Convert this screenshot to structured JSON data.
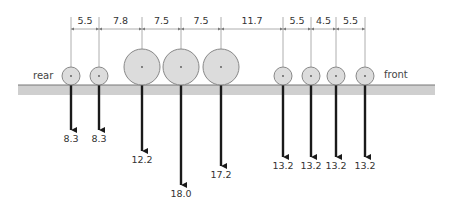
{
  "diagram": {
    "side_labels": {
      "rear": "rear",
      "front": "front"
    },
    "spacings": [
      "5.5",
      "7.8",
      "7.5",
      "7.5",
      "11.7",
      "5.5",
      "4.5",
      "5.5"
    ],
    "axles": [
      {
        "x": 71,
        "r": 9,
        "load": "8.3",
        "arrow_len": 45
      },
      {
        "x": 99,
        "r": 9,
        "load": "8.3",
        "arrow_len": 45
      },
      {
        "x": 142,
        "r": 18,
        "load": "12.2",
        "arrow_len": 66
      },
      {
        "x": 181,
        "r": 18,
        "load": "18.0",
        "arrow_len": 100
      },
      {
        "x": 221,
        "r": 18,
        "load": "17.2",
        "arrow_len": 81
      },
      {
        "x": 283,
        "r": 9,
        "load": "13.2",
        "arrow_len": 72
      },
      {
        "x": 311,
        "r": 9,
        "load": "13.2",
        "arrow_len": 72
      },
      {
        "x": 336,
        "r": 9,
        "load": "13.2",
        "arrow_len": 72
      },
      {
        "x": 365,
        "r": 9,
        "load": "13.2",
        "arrow_len": 72
      }
    ],
    "colors": {
      "wheel_fill": "#dcdcdc",
      "wheel_stroke": "#888888",
      "ground": "#cfcfcf",
      "arrow": "#1a1a1a"
    }
  }
}
